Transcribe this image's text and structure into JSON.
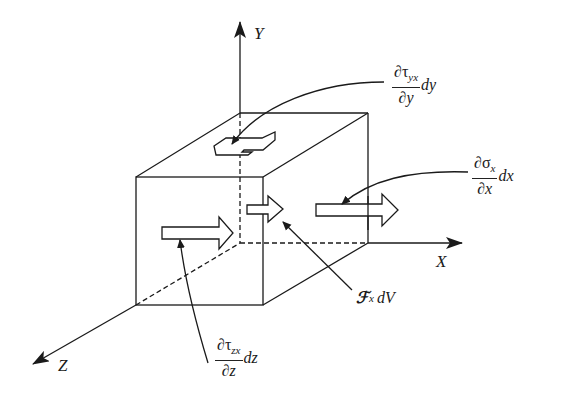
{
  "figure": {
    "type": "stress-element-diagram",
    "axes": {
      "x_label": "X",
      "y_label": "Y",
      "z_label": "Z"
    },
    "annotations": {
      "shear_yx": {
        "num_partial": "∂",
        "num_sym": "τ",
        "num_sub": "yx",
        "den": "∂y",
        "tail": "dy"
      },
      "normal_x": {
        "num_partial": "∂",
        "num_sym": "σ",
        "num_sub": "x",
        "den": "∂x",
        "tail": "dx"
      },
      "body_force": {
        "sym": "ℱ",
        "sub": "x",
        "tail": "dV"
      },
      "shear_zx": {
        "num_partial": "∂",
        "num_sym": "τ",
        "num_sub": "zx",
        "den": "∂z",
        "tail": "dz"
      }
    },
    "colors": {
      "line": "#1a1a1a",
      "background": "#ffffff"
    }
  }
}
